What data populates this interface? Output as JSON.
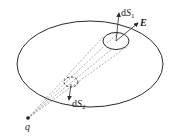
{
  "diagram": {
    "labels": {
      "dS1": {
        "prefix": "d",
        "var": "S",
        "sub": "1"
      },
      "dS2": {
        "prefix": "d",
        "var": "S",
        "sub": "2"
      },
      "E": "E",
      "q": "q"
    },
    "elements": {
      "closed_surface": {
        "cx": 90,
        "cy": 64,
        "rx": 73,
        "ry": 43
      },
      "area_element_1": {
        "cx": 116,
        "cy": 41,
        "rx": 13,
        "ry": 8.5
      },
      "area_element_2": {
        "cx": 71,
        "cy": 82,
        "rx": 7,
        "ry": 5
      },
      "charge_point": {
        "x": 28,
        "y": 118
      }
    },
    "colors": {
      "stroke": "#2a2a2a",
      "dashed": "#777777"
    }
  }
}
